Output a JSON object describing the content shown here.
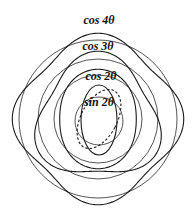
{
  "diagram": {
    "title": "",
    "center": [
      98,
      119
    ],
    "modes": [
      {
        "id": "cos4",
        "label": "cos 4θ",
        "n": 4,
        "fn": "cos",
        "radius": 79,
        "amplitude": 0.085,
        "label_pos": [
          99,
          24
        ],
        "style": "solid"
      },
      {
        "id": "cos3",
        "label": "cos 3θ",
        "n": 3,
        "fn": "cos",
        "radius": 60,
        "amplitude": 0.13,
        "label_pos": [
          98,
          50
        ],
        "style": "solid"
      },
      {
        "id": "cos2",
        "label": "cos 2θ",
        "n": 2,
        "fn": "cos",
        "radius": 44,
        "amplitude": 0.13,
        "label_pos": [
          101,
          80
        ],
        "style": "solid"
      },
      {
        "id": "sin2",
        "label": "sin 2θ",
        "n": 2,
        "fn": "sin",
        "radius": 32,
        "amplitude": 0.16,
        "label_pos": [
          98,
          105
        ],
        "style": "dashed"
      }
    ],
    "inner_oval": {
      "rx": 18,
      "ry": 35,
      "cx": 99,
      "cy": 120
    }
  }
}
